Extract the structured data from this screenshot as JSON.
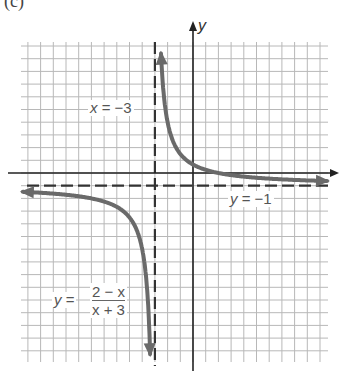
{
  "panel_label": "(c)",
  "colors": {
    "grid": "#b8b8b8",
    "axis": "#222222",
    "asymptote": "#333333",
    "curve": "#6a6a6a",
    "label": "#555555"
  },
  "chart_data": {
    "type": "line",
    "title": "",
    "function": "y = (2 - x)/(x + 3)",
    "xlabel": "",
    "ylabel": "y",
    "xlim": [
      -13.5,
      10.8
    ],
    "ylim": [
      -14.8,
      10.4
    ],
    "grid": true,
    "legend": "none",
    "asymptotes": [
      {
        "type": "vertical",
        "value": -3,
        "label": "x = −3",
        "style": "dashed"
      },
      {
        "type": "horizontal",
        "value": -1,
        "label": "y = −1",
        "style": "dashed"
      }
    ],
    "intercepts": {
      "x_intercept": 2,
      "y_intercept": 0.667
    },
    "series": [
      {
        "name": "right branch",
        "x": [
          -2.85,
          -2.8,
          -2.7,
          -2.5,
          -2.0,
          -1.0,
          0,
          1,
          2,
          4,
          6,
          8,
          10.5
        ],
        "y": [
          32.3,
          24.0,
          15.7,
          9.0,
          4.0,
          1.5,
          0.667,
          0.25,
          0,
          -0.286,
          -0.444,
          -0.545,
          -0.63
        ]
      },
      {
        "name": "left branch",
        "x": [
          -13.3,
          -12,
          -10,
          -8,
          -6,
          -5,
          -4,
          -3.5,
          -3.3,
          -3.15
        ],
        "y": [
          -1.49,
          -1.56,
          -1.71,
          -2.0,
          -2.67,
          -3.5,
          -6.0,
          -11.0,
          -17.7,
          -34.3
        ]
      }
    ],
    "annotations": [
      {
        "text": "x = −3",
        "near": "vertical asymptote, upper left"
      },
      {
        "text": "y = −1",
        "near": "horizontal asymptote, right"
      },
      {
        "text": "y = (2 − x)/(x + 3)",
        "near": "left branch, lower left"
      }
    ]
  },
  "labels": {
    "y_axis": "y",
    "va_x": "x",
    "va_eq": " = −3",
    "ha_y": "y",
    "ha_eq": " = −1",
    "fn_y": "y",
    "fn_eq": " = ",
    "fn_num": "2 − x",
    "fn_den": "x + 3"
  }
}
